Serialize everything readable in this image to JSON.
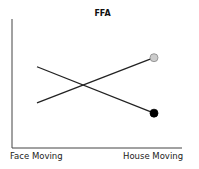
{
  "chart_data": {
    "type": "line",
    "title": "FFA",
    "xlabel": "",
    "ylabel": "",
    "categories": [
      "Face Moving",
      "House Moving"
    ],
    "series": [
      {
        "name": "Series A (gray marker)",
        "values": [
          0.35,
          0.7
        ],
        "marker_color": "#cccccc",
        "line_color": "#222222"
      },
      {
        "name": "Series B (black marker)",
        "values": [
          0.63,
          0.27
        ],
        "marker_color": "#000000",
        "line_color": "#222222"
      }
    ],
    "ylim": [
      0,
      1
    ],
    "grid": false,
    "legend": "none",
    "markers_only_on_last_point": true
  },
  "labels": {
    "title": "FFA",
    "x_left": "Face Moving",
    "x_right": "House Moving"
  }
}
